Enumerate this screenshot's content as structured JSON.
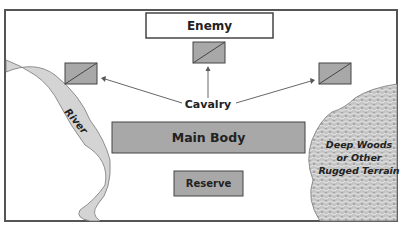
{
  "diagram": {
    "enemy_label": "Enemy",
    "cavalry_label": "Cavalry",
    "main_body_label": "Main Body",
    "reserve_label": "Reserve",
    "river_label": "River",
    "terrain_label_line1": "Deep Woods",
    "terrain_label_line2": "or Other",
    "terrain_label_line3": "Rugged Terrain"
  },
  "colors": {
    "unit_fill": "#a8a8a8",
    "river_fill": "#d4d4d4",
    "terrain_fill": "#bdbdbd",
    "frame_stroke": "#555555"
  }
}
